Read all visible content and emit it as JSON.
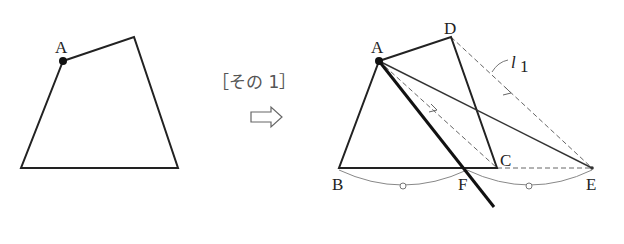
{
  "caption": "［その 1］",
  "arrow_icon": "double-right-arrow-icon",
  "left_figure": {
    "description": "Quadrilateral with point A marked",
    "labels": {
      "A": "A"
    },
    "vertices": {
      "A": [
        63,
        61
      ],
      "top_right": [
        134,
        37
      ],
      "bottom_right": [
        178,
        168
      ],
      "bottom_left": [
        21,
        168
      ]
    }
  },
  "right_figure": {
    "description": "Construction: quadrilateral ABCD, line l1 through D parallel to AC meets extension of BC at E, F is midpoint of BE, line AF bisects area",
    "labels": {
      "A": "A",
      "B": "B",
      "C": "C",
      "D": "D",
      "E": "E",
      "F": "F",
      "l1": "l",
      "l1_sub": "1"
    },
    "vertices": {
      "A": [
        379,
        61
      ],
      "D": [
        451,
        37
      ],
      "C": [
        497,
        168
      ],
      "B": [
        339,
        168
      ],
      "F": [
        467,
        168
      ],
      "E": [
        592,
        168
      ],
      "line_end": [
        494,
        207
      ]
    }
  },
  "colors": {
    "line": "#222222",
    "thin": "#333333",
    "dashed": "#666666",
    "arc": "#777777"
  }
}
